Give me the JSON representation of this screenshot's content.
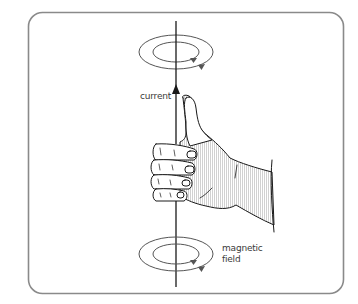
{
  "diagram": {
    "labels": {
      "current": "current",
      "magnetic_field_line1": "magnetic",
      "magnetic_field_line2": "field"
    },
    "colors": {
      "frame": "#8a8a8a",
      "wire": "#1a1a1a",
      "field_lines": "#555555",
      "field_arrows": "#555555",
      "hand_outline": "#1a1a1a",
      "hand_shading": "#d8d8d8",
      "background": "#ffffff"
    },
    "elements": [
      {
        "name": "frame",
        "type": "rounded-rectangle"
      },
      {
        "name": "wire",
        "type": "vertical-line",
        "direction": "up"
      },
      {
        "name": "current-arrow",
        "type": "arrowhead",
        "direction": "up"
      },
      {
        "name": "top-field-loops",
        "type": "concentric-ellipses",
        "count": 2
      },
      {
        "name": "bottom-field-loops",
        "type": "concentric-ellipses",
        "count": 2
      },
      {
        "name": "right-hand",
        "type": "illustration",
        "pose": "thumb up, fingers curled around wire"
      }
    ]
  }
}
